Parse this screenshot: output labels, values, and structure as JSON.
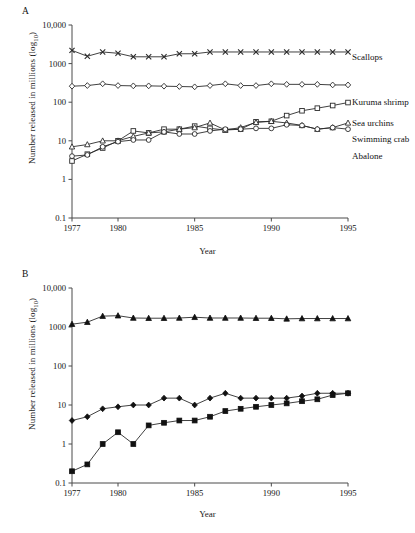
{
  "figure": {
    "panel_a_letter": "A",
    "panel_b_letter": "B"
  },
  "axes": {
    "ylabel_main": "Number released in millions (log",
    "ylabel_sub": "10",
    "ylabel_close": ")",
    "xlabel": "Year",
    "y_ticks": [
      "10,000",
      "1000",
      "100",
      "10",
      "1",
      "0.1"
    ],
    "x_ticks": [
      "1977",
      "1980",
      "1985",
      "1990",
      "1995"
    ]
  },
  "chart_data": [
    {
      "type": "line",
      "panel": "A",
      "title": "",
      "xlabel": "Year",
      "ylabel": "Number released in millions (log10)",
      "yscale": "log10",
      "ylim": [
        0.1,
        10000
      ],
      "xlim": [
        1977,
        1995
      ],
      "grid": false,
      "legend_position": "right-inline",
      "x": [
        1977,
        1978,
        1979,
        1980,
        1981,
        1982,
        1983,
        1984,
        1985,
        1986,
        1987,
        1988,
        1989,
        1990,
        1991,
        1992,
        1993,
        1994,
        1995
      ],
      "series": [
        {
          "name": "Scallops",
          "marker": "cross-x",
          "values": [
            2200,
            1550,
            2000,
            1850,
            1500,
            1500,
            1500,
            1800,
            1800,
            2000,
            2000,
            2000,
            2000,
            2000,
            2000,
            2000,
            2000,
            2000,
            2000
          ]
        },
        {
          "name": "Kuruma shrimp",
          "marker": "open-diamond",
          "values": [
            260,
            270,
            300,
            270,
            265,
            265,
            260,
            255,
            250,
            270,
            300,
            270,
            270,
            300,
            290,
            290,
            290,
            280,
            280
          ]
        },
        {
          "name": "Sea urchins",
          "marker": "open-square",
          "values": [
            3,
            4.5,
            6.5,
            10,
            18,
            16,
            20,
            20,
            24,
            21,
            19,
            20,
            31,
            32,
            45,
            60,
            70,
            82,
            98
          ]
        },
        {
          "name": "Swimming crab",
          "marker": "open-triangle",
          "values": [
            7,
            8,
            10,
            10,
            13,
            16,
            17,
            20,
            22,
            29,
            19,
            22,
            30,
            32,
            29,
            25,
            20,
            22,
            29
          ]
        },
        {
          "name": "Abalone",
          "marker": "open-circle",
          "values": [
            4,
            4.3,
            7,
            9.5,
            10.5,
            10.5,
            17,
            15,
            15,
            18,
            20,
            20,
            21,
            21,
            26,
            25,
            20,
            22,
            20
          ]
        }
      ]
    },
    {
      "type": "line",
      "panel": "B",
      "title": "",
      "xlabel": "Year",
      "ylabel": "Number released in millions (log10)",
      "yscale": "log10",
      "ylim": [
        0.1,
        10000
      ],
      "xlim": [
        1977,
        1995
      ],
      "grid": false,
      "legend_position": "right-inline",
      "x": [
        1977,
        1978,
        1979,
        1980,
        1981,
        1982,
        1983,
        1984,
        1985,
        1986,
        1987,
        1988,
        1989,
        1990,
        1991,
        1992,
        1993,
        1994,
        1995
      ],
      "series": [
        {
          "name": "Chum salmon",
          "marker": "filled-triangle",
          "values": [
            1180,
            1330,
            1900,
            1950,
            1700,
            1680,
            1680,
            1700,
            1780,
            1700,
            1700,
            1700,
            1680,
            1680,
            1620,
            1650,
            1650,
            1650,
            1650
          ]
        },
        {
          "name": "Red sea bream",
          "marker": "filled-diamond",
          "values": [
            4,
            5,
            8,
            9,
            10,
            10,
            15,
            15,
            10,
            15,
            20,
            15,
            15,
            15,
            15,
            17,
            20,
            20,
            20
          ]
        },
        {
          "name": "Flounder",
          "marker": "filled-square",
          "values": [
            0.2,
            0.3,
            1,
            2,
            1,
            3,
            3.5,
            4,
            4,
            5,
            7,
            8,
            9,
            10,
            11,
            12.5,
            14,
            18,
            20
          ]
        }
      ]
    }
  ],
  "series_labels": {
    "a": [
      "Scallops",
      "Kuruma shrimp",
      "Sea urchins",
      "Swimming crab",
      "Abalone"
    ],
    "b": [
      "Chum salmon",
      "Red sea bream",
      "Flounder"
    ]
  }
}
